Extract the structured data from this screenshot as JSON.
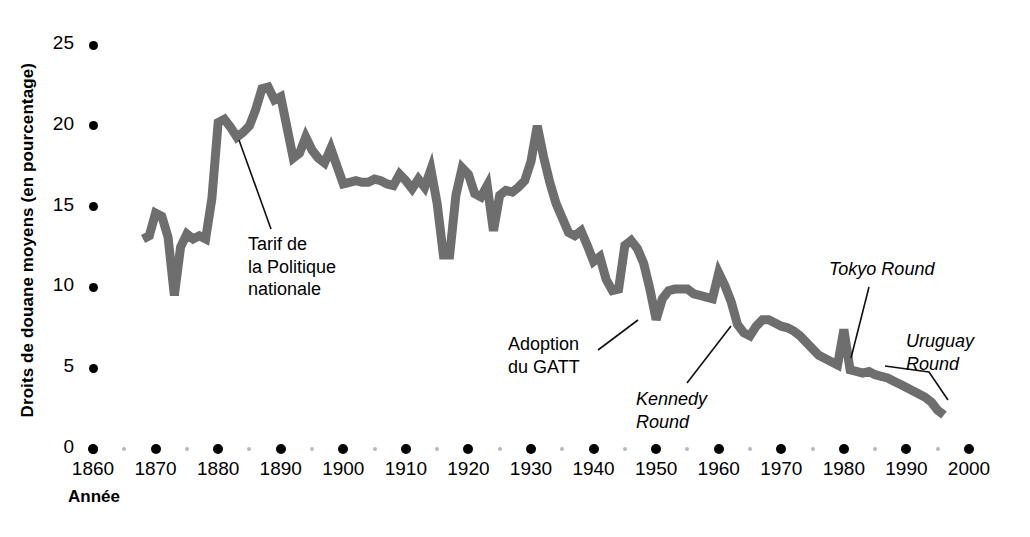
{
  "figure": {
    "background": "#ffffff",
    "line_color": "#6e6e6e",
    "tick_color": "#000000",
    "minor_tick_color": "#b9b9b9"
  },
  "axes": {
    "y_title": "Droits de douane moyens (en pourcentage)",
    "x_title": "Année",
    "y_ticks": [
      "0",
      "5",
      "10",
      "15",
      "20",
      "25"
    ],
    "x_ticks": [
      "1860",
      "1870",
      "1880",
      "1890",
      "1900",
      "1910",
      "1920",
      "1930",
      "1940",
      "1950",
      "1960",
      "1970",
      "1980",
      "1990",
      "2000"
    ]
  },
  "annotations": [
    {
      "id": "tarif-politique-nationale",
      "text": "Tarif de\nla Politique\nnationale",
      "style": "roman"
    },
    {
      "id": "adoption-gatt",
      "text": "Adoption\ndu GATT",
      "style": "roman"
    },
    {
      "id": "kennedy-round",
      "text": "Kennedy\nRound",
      "style": "italic"
    },
    {
      "id": "tokyo-round",
      "text": "Tokyo Round",
      "style": "italic"
    },
    {
      "id": "uruguay-round",
      "text": "Uruguay\nRound",
      "style": "italic"
    }
  ],
  "chart_data": {
    "type": "line",
    "title": "",
    "xlabel": "Année",
    "ylabel": "Droits de douane moyens (en pourcentage)",
    "xlim": [
      1860,
      2000
    ],
    "ylim": [
      0,
      25
    ],
    "grid": false,
    "legend": null,
    "series": [
      {
        "name": "Droits de douane moyens",
        "color": "#6e6e6e",
        "x": [
          1868,
          1869,
          1870,
          1871,
          1872,
          1873,
          1874,
          1875,
          1876,
          1877,
          1878,
          1879,
          1880,
          1881,
          1882,
          1883,
          1884,
          1885,
          1886,
          1887,
          1888,
          1889,
          1890,
          1891,
          1892,
          1893,
          1894,
          1895,
          1896,
          1897,
          1898,
          1899,
          1900,
          1901,
          1902,
          1903,
          1904,
          1905,
          1906,
          1907,
          1908,
          1909,
          1910,
          1911,
          1912,
          1913,
          1914,
          1915,
          1916,
          1917,
          1918,
          1919,
          1920,
          1921,
          1922,
          1923,
          1924,
          1925,
          1926,
          1927,
          1928,
          1929,
          1930,
          1931,
          1932,
          1933,
          1934,
          1935,
          1936,
          1937,
          1938,
          1939,
          1940,
          1941,
          1942,
          1943,
          1944,
          1945,
          1946,
          1947,
          1948,
          1949,
          1950,
          1951,
          1952,
          1953,
          1954,
          1955,
          1956,
          1957,
          1958,
          1959,
          1960,
          1961,
          1962,
          1963,
          1964,
          1965,
          1966,
          1967,
          1968,
          1969,
          1970,
          1971,
          1972,
          1973,
          1974,
          1975,
          1976,
          1977,
          1978,
          1979,
          1980,
          1981,
          1982,
          1983,
          1984,
          1985,
          1986,
          1987,
          1988,
          1989,
          1990,
          1991,
          1992,
          1993,
          1994,
          1995,
          1996
        ],
        "y": [
          13.0,
          13.2,
          14.6,
          14.4,
          13.1,
          9.5,
          12.5,
          13.3,
          13.0,
          13.2,
          13.0,
          15.5,
          20.2,
          20.4,
          19.9,
          19.3,
          19.6,
          20.0,
          21.0,
          22.3,
          22.4,
          21.6,
          21.8,
          19.9,
          18.0,
          18.3,
          19.3,
          18.5,
          18.0,
          17.7,
          18.6,
          17.5,
          16.4,
          16.5,
          16.6,
          16.5,
          16.5,
          16.7,
          16.6,
          16.4,
          16.3,
          17.0,
          16.6,
          16.1,
          16.7,
          16.2,
          17.3,
          15.2,
          12.0,
          12.0,
          15.7,
          17.4,
          17.0,
          15.8,
          15.6,
          16.3,
          13.5,
          15.7,
          16.0,
          15.9,
          16.2,
          16.6,
          17.8,
          20.0,
          18.1,
          16.5,
          15.2,
          14.3,
          13.4,
          13.2,
          13.5,
          12.6,
          11.6,
          11.9,
          10.5,
          9.8,
          9.9,
          12.6,
          12.9,
          12.4,
          11.5,
          9.9,
          8.0,
          9.3,
          9.8,
          9.9,
          9.9,
          9.9,
          9.6,
          9.5,
          9.4,
          9.3,
          10.9,
          10.1,
          9.1,
          7.7,
          7.2,
          7.0,
          7.6,
          8.0,
          8.0,
          7.8,
          7.6,
          7.5,
          7.3,
          7.0,
          6.6,
          6.2,
          5.8,
          5.6,
          5.4,
          5.2,
          7.4,
          4.9,
          4.8,
          4.7,
          4.8,
          4.6,
          4.5,
          4.4,
          4.2,
          4.0,
          3.8,
          3.6,
          3.4,
          3.2,
          2.9,
          2.4,
          2.1
        ]
      }
    ]
  }
}
